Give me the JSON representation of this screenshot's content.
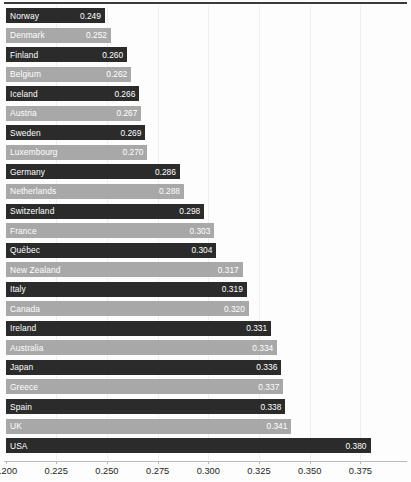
{
  "chart_data": {
    "type": "bar",
    "orientation": "horizontal",
    "title": "",
    "subtitle": "",
    "xlabel": "",
    "ylabel": "",
    "xlim": [
      0.2,
      0.3938
    ],
    "xticks": [
      0.2,
      0.225,
      0.25,
      0.275,
      0.3,
      0.325,
      0.35,
      0.375
    ],
    "xtick_labels": [
      "0.200",
      "0.225",
      "0.250",
      "0.275",
      "0.300",
      "0.325",
      "0.350",
      "0.375"
    ],
    "grid": "vertical",
    "legend": "none",
    "value_labels_shown": true,
    "categories": [
      "Norway",
      "Denmark",
      "Finland",
      "Belgium",
      "Iceland",
      "Austria",
      "Sweden",
      "Luxembourg",
      "Germany",
      "Netherlands",
      "Switzerland",
      "France",
      "Québec",
      "New Zealand",
      "Italy",
      "Canada",
      "Ireland",
      "Australia",
      "Japan",
      "Greece",
      "Spain",
      "UK",
      "USA"
    ],
    "values": [
      0.249,
      0.252,
      0.26,
      0.262,
      0.266,
      0.267,
      0.269,
      0.27,
      0.286,
      0.288,
      0.298,
      0.303,
      0.304,
      0.317,
      0.319,
      0.32,
      0.331,
      0.334,
      0.336,
      0.337,
      0.338,
      0.341,
      0.38
    ],
    "value_label_texts": [
      "0.249",
      "0.252",
      "0.260",
      "0.262",
      "0.266",
      "0.267",
      "0.269",
      "0.270",
      "0.286",
      "0.288",
      "0.298",
      "0.303",
      "0.304",
      "0.317",
      "0.319",
      "0.320",
      "0.331",
      "0.334",
      "0.336",
      "0.337",
      "0.338",
      "0.341",
      "0.380"
    ],
    "bar_shades": [
      "dark",
      "light",
      "dark",
      "light",
      "dark",
      "light",
      "dark",
      "light",
      "dark",
      "light",
      "dark",
      "light",
      "dark",
      "light",
      "dark",
      "light",
      "dark",
      "light",
      "dark",
      "light",
      "dark",
      "light",
      "dark"
    ]
  },
  "colors": {
    "bar_dark": "#2b2b2b",
    "bar_light": "#a8a8a8",
    "bar_text": "#ffffff",
    "gridline": "#ededf2",
    "axis_line": "#b9b9bf",
    "axis_text": "#1d1d1d",
    "top_rule": "#3a3a3a",
    "background": "#fdfdfd"
  }
}
